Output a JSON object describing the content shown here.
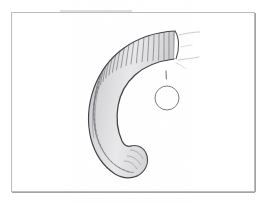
{
  "document": {
    "type": "scientific-illustration",
    "medium": "pencil-graphite-drawing",
    "title": "Curved ribbed horn specimen drawing",
    "width_px": 269,
    "height_px": 203,
    "background_color": "#ffffff"
  },
  "frame": {
    "name": "plate-border",
    "x": 11,
    "y": 12,
    "width": 244,
    "height": 180,
    "stroke_color": "#b9b9bc",
    "stroke_width": 1,
    "shadow_color": "#9a9a9d"
  },
  "specimen": {
    "name": "ribbed-horn",
    "description": "Curved horn with dense transverse ribbing, wide striated base at upper right tapering to a blunt rounded tip at lower centre",
    "outline_color": "#3a3a3c",
    "rib_color": "#6e6e72",
    "shade_color": "#9b9b9f",
    "highlight_color": "#f2f2f3",
    "rib_count": 46,
    "outer_edge": [
      [
        175,
        33
      ],
      [
        160,
        35
      ],
      [
        144,
        39
      ],
      [
        130,
        46
      ],
      [
        118,
        55
      ],
      [
        107,
        66
      ],
      [
        99,
        79
      ],
      [
        94,
        93
      ],
      [
        91,
        108
      ],
      [
        90,
        122
      ],
      [
        92,
        135
      ],
      [
        96,
        147
      ],
      [
        102,
        158
      ],
      [
        110,
        166
      ],
      [
        119,
        171
      ]
    ],
    "inner_edge": [
      [
        176,
        58
      ],
      [
        163,
        60
      ],
      [
        151,
        63
      ],
      [
        140,
        69
      ],
      [
        131,
        77
      ],
      [
        124,
        87
      ],
      [
        119,
        99
      ],
      [
        117,
        112
      ],
      [
        118,
        126
      ],
      [
        122,
        139
      ],
      [
        128,
        150
      ],
      [
        136,
        158
      ],
      [
        144,
        163
      ]
    ],
    "tip": {
      "name": "blunt-tip",
      "cx": 131,
      "cy": 168,
      "rx": 16,
      "ry": 10,
      "rotation_deg": 35
    },
    "base": {
      "name": "striated-base",
      "x": 172,
      "y": 31,
      "width": 10,
      "height": 28
    }
  },
  "scale_marker": {
    "name": "reference-circle",
    "cx": 167,
    "cy": 98,
    "r": 12,
    "stroke_color": "#7a7a7e",
    "stroke_width": 1,
    "fill": "none"
  },
  "tick_mark": {
    "name": "alignment-tick",
    "x": 166,
    "y1": 71,
    "y2": 79,
    "stroke_color": "#6a6a6e"
  },
  "construction_lines": [
    {
      "name": "guide-line-upper",
      "x1": 179,
      "y1": 36,
      "x2": 199,
      "y2": 33,
      "color": "#c4c4c7"
    },
    {
      "name": "guide-line-lower",
      "x1": 178,
      "y1": 60,
      "x2": 198,
      "y2": 58,
      "color": "#c4c4c7"
    },
    {
      "name": "guide-line-short",
      "x1": 180,
      "y1": 48,
      "x2": 190,
      "y2": 46,
      "color": "#d0d0d3"
    }
  ],
  "smudges": [
    {
      "name": "top-edge-smudge",
      "x": 60,
      "y": 11,
      "width": 70,
      "height": 3,
      "color": "#d6d6d9"
    }
  ]
}
